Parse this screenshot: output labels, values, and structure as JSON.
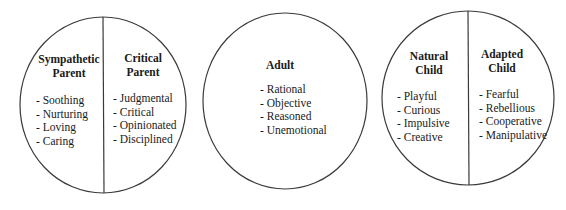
{
  "diagram": {
    "line_color": "#3a3a3a",
    "circles": [
      {
        "name": "Parent",
        "halves": [
          {
            "title": [
              "Sympathetic",
              "Parent"
            ],
            "traits": [
              "- Soothing",
              "- Nurturing",
              "- Loving",
              "- Caring"
            ]
          },
          {
            "title": [
              "Critical",
              "Parent"
            ],
            "traits": [
              "- Judgmental",
              "- Critical",
              "- Opinionated",
              "- Disciplined"
            ]
          }
        ]
      },
      {
        "name": "Adult",
        "title": [
          "Adult"
        ],
        "traits": [
          "- Rational",
          "- Objective",
          "- Reasoned",
          "- Unemotional"
        ]
      },
      {
        "name": "Child",
        "halves": [
          {
            "title": [
              "Natural",
              "Child"
            ],
            "traits": [
              "- Playful",
              "- Curious",
              "- Impulsive",
              "- Creative"
            ]
          },
          {
            "title": [
              "Adapted",
              "Child"
            ],
            "traits": [
              "- Fearful",
              "- Rebellious",
              "- Cooperative",
              "- Manipulative"
            ]
          }
        ]
      }
    ]
  }
}
